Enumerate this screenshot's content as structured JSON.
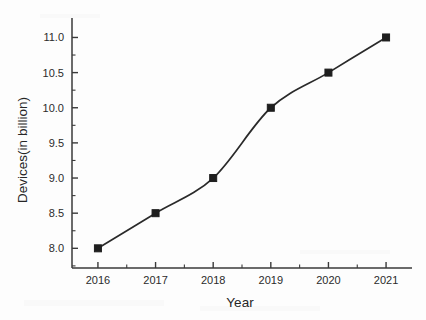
{
  "chart_data": {
    "type": "line",
    "title": "",
    "xlabel": "Year",
    "ylabel": "Devices(in billion)",
    "categories": [
      "2016",
      "2017",
      "2018",
      "2019",
      "2020",
      "2021"
    ],
    "x": [
      2016,
      2017,
      2018,
      2019,
      2020,
      2021
    ],
    "values": [
      8.0,
      8.5,
      9.0,
      10.0,
      10.5,
      11.0
    ],
    "series": [
      {
        "name": "Devices",
        "values": [
          8.0,
          8.5,
          9.0,
          10.0,
          10.5,
          11.0
        ]
      }
    ],
    "xlim": [
      2015.55,
      2021.45
    ],
    "ylim": [
      7.72,
      11.22
    ],
    "xtick_labels": [
      "2016",
      "2017",
      "2018",
      "2019",
      "2020",
      "2021"
    ],
    "ytick_labels": [
      "8.0",
      "8.5",
      "9.0",
      "9.5",
      "10.0",
      "10.5",
      "11.0"
    ],
    "ytick_values": [
      8.0,
      8.5,
      9.0,
      9.5,
      10.0,
      10.5,
      11.0
    ],
    "y_minor_step": 0.25,
    "x_minor_step": 0.5,
    "grid": false,
    "legend": false,
    "legend_position": "none",
    "marker": "square",
    "line_style": "smooth-spline",
    "line_color": "#2a2a2a",
    "marker_color": "#1e1e1e",
    "axis_color": "#3a3a3a",
    "background_color": "#fdfdfd",
    "axis_frame": "left-bottom",
    "tick_direction": "in"
  },
  "axis": {
    "x_title": "Year",
    "y_title": "Devices(in billion)"
  }
}
